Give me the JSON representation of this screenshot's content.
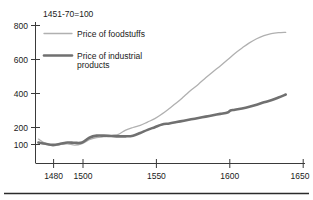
{
  "chart_data": {
    "type": "line",
    "title": "1451-70=100",
    "subtitle": "",
    "xlabel": "",
    "ylabel": "",
    "xlim": [
      1468,
      1652
    ],
    "ylim": [
      60,
      830
    ],
    "grid": false,
    "legend_position": "top-left",
    "y_ticks": [
      100,
      200,
      400,
      600,
      800
    ],
    "y_tick_labels": [
      "100",
      "200",
      "400",
      "600",
      "800"
    ],
    "x_ticks": [
      1480,
      1500,
      1550,
      1600,
      1650
    ],
    "x_tick_labels": [
      "1480",
      "1500",
      "1550",
      "1600",
      "1650"
    ],
    "series": [
      {
        "name": "Price of foodstuffs",
        "color": "#b0b0b0",
        "width": 1.3,
        "x": [
          1470,
          1475,
          1480,
          1485,
          1490,
          1495,
          1500,
          1505,
          1510,
          1515,
          1520,
          1525,
          1530,
          1535,
          1540,
          1545,
          1550,
          1555,
          1560,
          1565,
          1570,
          1575,
          1580,
          1585,
          1590,
          1595,
          1600,
          1605,
          1610,
          1615,
          1620,
          1625,
          1630,
          1635,
          1640
        ],
        "values": [
          132,
          105,
          92,
          100,
          104,
          96,
          105,
          128,
          140,
          146,
          152,
          160,
          185,
          200,
          212,
          232,
          252,
          280,
          312,
          345,
          382,
          420,
          455,
          492,
          528,
          562,
          598,
          636,
          668,
          698,
          722,
          740,
          752,
          758,
          760
        ]
      },
      {
        "name": "Price of industrial products",
        "color": "#707070",
        "width": 2.6,
        "x": [
          1470,
          1475,
          1480,
          1485,
          1490,
          1495,
          1500,
          1505,
          1510,
          1515,
          1520,
          1525,
          1530,
          1535,
          1540,
          1545,
          1550,
          1555,
          1560,
          1565,
          1570,
          1575,
          1580,
          1585,
          1590,
          1595,
          1600,
          1602,
          1605,
          1610,
          1615,
          1620,
          1625,
          1630,
          1635,
          1640
        ],
        "values": [
          112,
          104,
          98,
          104,
          112,
          110,
          112,
          140,
          152,
          152,
          150,
          148,
          148,
          152,
          168,
          186,
          202,
          218,
          224,
          232,
          240,
          248,
          256,
          264,
          272,
          280,
          288,
          300,
          304,
          312,
          322,
          334,
          348,
          360,
          376,
          394
        ]
      }
    ],
    "legend": [
      {
        "label": "Price of foodstuffs",
        "color": "#b0b0b0",
        "width": 1.3
      },
      {
        "label": "Price of industrial products",
        "color": "#707070",
        "width": 2.6
      }
    ]
  },
  "legend_text": {
    "item0_line1": "Price of foodstuffs",
    "item0_line2": "",
    "item1_line1": "Price of industrial",
    "item1_line2": "products"
  },
  "colors": {
    "foodstuffs": "#b0b0b0",
    "industrial": "#707070",
    "axis": "#3a3a3a",
    "text": "#1a1a1a",
    "rule": "#2b2b2b",
    "background": "#ffffff"
  }
}
